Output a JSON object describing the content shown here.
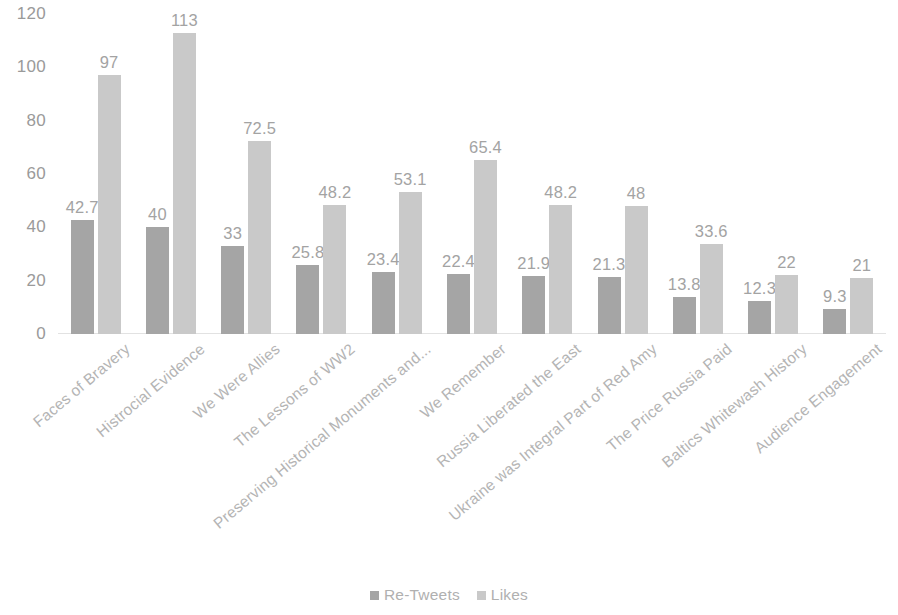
{
  "chart_data": {
    "type": "bar",
    "title": "",
    "subtitle": "",
    "xlabel": "",
    "ylabel": "",
    "ylim": [
      0,
      120
    ],
    "yticks": [
      "0",
      "20",
      "40",
      "60",
      "80",
      "100",
      "120"
    ],
    "ytick_values": [
      0,
      20,
      40,
      60,
      80,
      100,
      120
    ],
    "grid": false,
    "legend_position": "bottom-center",
    "orientation": "vertical",
    "grouping": "grouped",
    "categories": [
      "Faces of Bravery",
      "Histrocial Evidence",
      "We Were Allies",
      "The Lessons of WW2",
      "Preserving Historical Monuments and...",
      "We Remember",
      "Russia Liberated the East",
      "Ukraine was Integral Part of Red Amy",
      "The Price Russia Paid",
      "Baltics Whitewash History",
      "Audience Engagement"
    ],
    "series": [
      {
        "name": "Re-Tweets",
        "color": "#a5a5a5",
        "values": [
          42.7,
          40,
          33,
          25.8,
          23.4,
          22.4,
          21.9,
          21.3,
          13.8,
          12.3,
          9.3
        ],
        "labels": [
          "42.7",
          "40",
          "33",
          "25.8",
          "23.4",
          "22.4",
          "21.9",
          "21.3",
          "13.8",
          "12.3",
          "9.3"
        ]
      },
      {
        "name": "Likes",
        "color": "#c9c9c9",
        "values": [
          97,
          113,
          72.5,
          48.2,
          53.1,
          65.4,
          48.2,
          48,
          33.6,
          22,
          21
        ],
        "labels": [
          "97",
          "113",
          "72.5",
          "48.2",
          "53.1",
          "65.4",
          "48.2",
          "48",
          "33.6",
          "22",
          "21"
        ]
      }
    ]
  },
  "legend": {
    "items": [
      {
        "label": "Re-Tweets",
        "color": "#a5a5a5"
      },
      {
        "label": "Likes",
        "color": "#c9c9c9"
      }
    ]
  }
}
